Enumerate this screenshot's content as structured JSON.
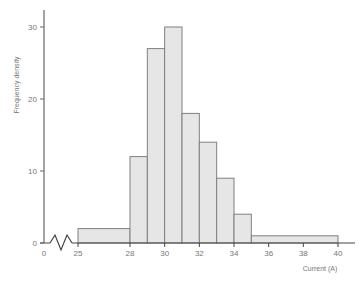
{
  "chart_data": {
    "type": "bar",
    "subtype": "histogram",
    "title": "",
    "xlabel": "Current (A)",
    "ylabel": "Frequency density",
    "x_ticks": [
      0,
      25,
      28,
      30,
      32,
      34,
      36,
      38,
      40
    ],
    "y_ticks": [
      0,
      10,
      20,
      30
    ],
    "ylim": [
      0,
      32
    ],
    "axis_break": "zigzag between 0 and 25 on x-axis",
    "grid": false,
    "bins": [
      {
        "from": 25,
        "to": 28,
        "density": 2
      },
      {
        "from": 28,
        "to": 29,
        "density": 12
      },
      {
        "from": 29,
        "to": 30,
        "density": 27
      },
      {
        "from": 30,
        "to": 31,
        "density": 30
      },
      {
        "from": 31,
        "to": 32,
        "density": 18
      },
      {
        "from": 32,
        "to": 33,
        "density": 14
      },
      {
        "from": 33,
        "to": 34,
        "density": 9
      },
      {
        "from": 34,
        "to": 35,
        "density": 4
      },
      {
        "from": 35,
        "to": 40,
        "density": 1
      }
    ],
    "colors": {
      "bar_fill": "#e6e6e6",
      "bar_stroke": "#808080",
      "axis": "#666666"
    }
  }
}
